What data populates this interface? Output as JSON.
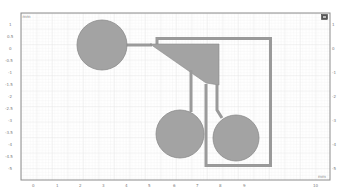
{
  "view": {
    "unit_top_left": "mm",
    "unit_bottom_right": "mm",
    "y_ticks": [
      "1",
      "0.5",
      "0",
      "-0.5",
      "-1",
      "-1.5",
      "-2",
      "-2.5",
      "-3",
      "-3.5",
      "-4",
      "-4.5",
      "-5"
    ],
    "x_ticks": [
      "0",
      "1",
      "2",
      "3",
      "4",
      "5",
      "6",
      "7",
      "8",
      "9",
      "10"
    ],
    "right_ticks": [
      "1",
      "0.5",
      "0",
      "-0.5",
      "-1",
      "-1.5",
      "-2",
      "-2.5",
      "-3",
      "-3.5",
      "-4",
      "-4.5",
      "-5"
    ]
  },
  "toolbar": {
    "view_icon": "camera-icon"
  },
  "colors": {
    "background": "#ffffff",
    "grid_minor": "#e9e9e9",
    "grid_major": "#dcdcdc",
    "frame": "#8c8c8c",
    "geometry_fill": "#a3a3a3",
    "geometry_stroke": "#8a8a8a",
    "trace": "#9a9a9a"
  },
  "geometry": {
    "pads": [
      {
        "name": "pad-large",
        "cx": 102,
        "cy": 45,
        "r": 25
      },
      {
        "name": "pad-bottom-left",
        "cx": 180,
        "cy": 134,
        "r": 24
      },
      {
        "name": "pad-bottom-right",
        "cx": 236,
        "cy": 138,
        "r": 23
      }
    ]
  }
}
